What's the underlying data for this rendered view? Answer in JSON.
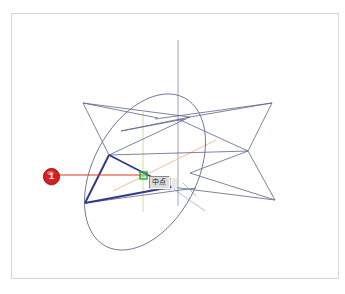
{
  "app": {
    "window_title": "CAD 3D Viewport",
    "background_color": "#ffffff",
    "frame_border_color": "#d6d6d6"
  },
  "viewport": {
    "name": "model-viewport",
    "width": 345,
    "height": 294
  },
  "tooltip": {
    "label": "中点",
    "meaning": "midpoint-snap",
    "background_color": "#dcdcdc",
    "border_color": "#8a8a8a",
    "x": 149,
    "y": 176
  },
  "callout": {
    "number": "1",
    "color": "#d81f1f",
    "leader_color": "#d83a1a",
    "leader_from_x": 57,
    "leader_to_x": 145,
    "leader_y": 175
  },
  "snap_marker": {
    "name": "midpoint-snap-marker",
    "color": "#22aa33",
    "x": 143,
    "y": 175,
    "size": 6
  },
  "geometry": {
    "ellipse": {
      "name": "ellipse-outline",
      "stroke": "#6a6f93",
      "cx": 145,
      "cy": 172,
      "rx": 52,
      "ry": 84,
      "rotation_deg": 28
    },
    "wireframe_stroke": "#5d6386",
    "selected_stroke": "#2f3a8c",
    "axis_stroke": "#9a9aa8",
    "tracking_vertical_stroke": "#cfd99a",
    "tracking_diagonal_stroke": "#f0c9a8",
    "bowtie_left": [
      [
        83,
        103
      ],
      [
        154,
        118
      ],
      [
        86,
        153
      ],
      [
        181,
        120
      ]
    ],
    "bowtie_right": [
      [
        272,
        103
      ],
      [
        248,
        151
      ],
      [
        275,
        200
      ],
      [
        182,
        170
      ]
    ],
    "selected_triangle": [
      [
        109,
        155
      ],
      [
        143,
        175
      ],
      [
        171,
        187
      ],
      [
        85,
        203
      ]
    ],
    "vertical_axis": {
      "x": 178,
      "y1": 40,
      "y2": 205
    }
  },
  "labels": {
    "viewport_name": "3d-modeling-viewport"
  }
}
